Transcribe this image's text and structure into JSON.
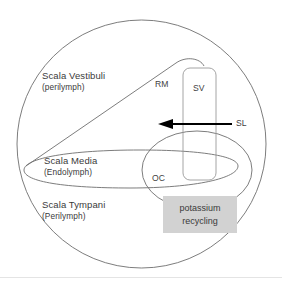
{
  "figure": {
    "background_color": "#ffffff",
    "stroke_color": "#6e6e6e",
    "text_color": "#3a3a3a",
    "arrow_color": "#000000",
    "highlight_color": "#d2d2d2"
  },
  "compartments": [
    {
      "id": "scala-vestibuli",
      "name": "Scala Vestibuli",
      "fluid": "(perilymph)"
    },
    {
      "id": "scala-media",
      "name": "Scala Media",
      "fluid": "(Endolymph)"
    },
    {
      "id": "scala-tympani",
      "name": "Scala Tympani",
      "fluid": "(Perilymph)"
    }
  ],
  "structures": {
    "rm": "RM",
    "sv": "SV",
    "sl": "SL",
    "oc": "OC"
  },
  "callout": {
    "line1": "potassium",
    "line2": "recycling"
  }
}
